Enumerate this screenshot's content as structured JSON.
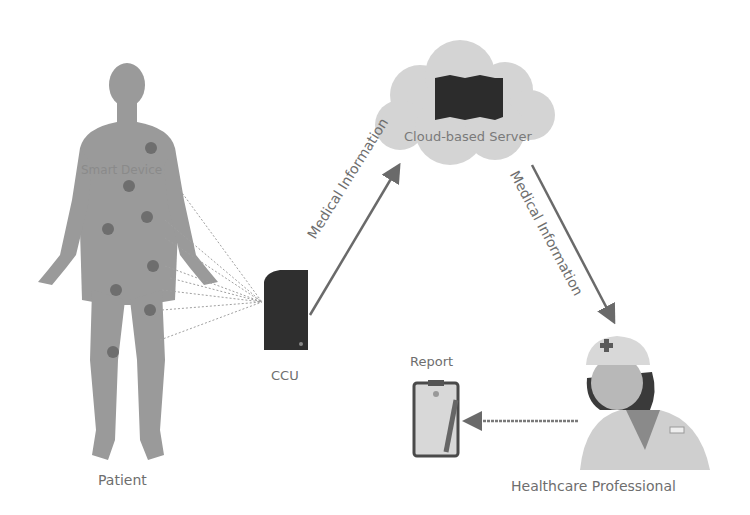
{
  "diagram": {
    "nodes": {
      "patient": {
        "label": "Patient"
      },
      "smart_device": {
        "label": "Smart Device"
      },
      "ccu": {
        "label": "CCU"
      },
      "cloud_server": {
        "label": "Cloud-based Server"
      },
      "healthcare_professional": {
        "label": "Healthcare Professional"
      },
      "report": {
        "label": "Report"
      }
    },
    "edges": [
      {
        "from": "ccu",
        "to": "cloud_server",
        "label": "Medical Information"
      },
      {
        "from": "cloud_server",
        "to": "healthcare_professional",
        "label": "Medical Information"
      },
      {
        "from": "healthcare_professional",
        "to": "report",
        "label": ""
      }
    ],
    "colors": {
      "body": "#9a9a9a",
      "sensor": "#6e6e6e",
      "ccu": "#2f2f2f",
      "cloud": "#d2d2d2",
      "arrow": "#6a6a6a",
      "text": "#6e6e6e"
    }
  }
}
